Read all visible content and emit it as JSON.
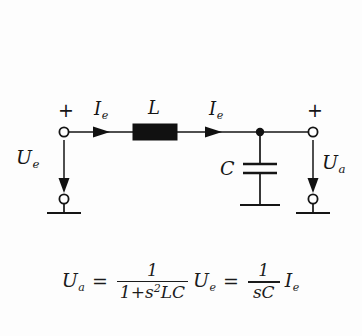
{
  "figure": {
    "background_color": "#fdfdfd",
    "ink_color": "#151515"
  },
  "circuit": {
    "input_port": {
      "polarity_label": "+",
      "voltage_label": "U",
      "voltage_sub": "e",
      "current_label": "I",
      "current_sub": "e"
    },
    "output_port": {
      "polarity_label": "+",
      "voltage_label": "U",
      "voltage_sub": "a",
      "current_label": "I",
      "current_sub": "e"
    },
    "components": [
      {
        "id": "inductor",
        "label": "L",
        "type": "inductor-block"
      },
      {
        "id": "capacitor",
        "label": "C",
        "type": "capacitor-plates"
      }
    ]
  },
  "formula": {
    "lhs": "U",
    "lhs_sub": "a",
    "eq1": "=",
    "frac1_num": "1",
    "frac1_den_lead": "1+",
    "frac1_den_s": "s",
    "frac1_den_exp": "2",
    "frac1_den_tail": "LC",
    "mult1": "U",
    "mult1_sub": "e",
    "eq2": "=",
    "frac2_num": "1",
    "frac2_den": "sC",
    "mult2": "I",
    "mult2_sub": "e"
  }
}
